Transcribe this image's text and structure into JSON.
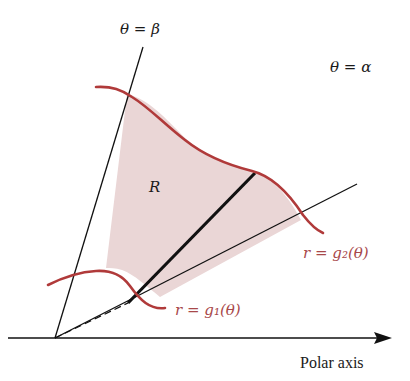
{
  "diagram": {
    "type": "polar-region",
    "labels": {
      "theta_beta": "θ = β",
      "theta_alpha": "θ = α",
      "region": "R",
      "outer_curve": "r = g₂(θ)",
      "inner_curve": "r = g₁(θ)",
      "axis": "Polar axis"
    },
    "colors": {
      "curve": "#b03a3a",
      "region_fill": "#ead6d6",
      "lines": "#111111",
      "curve_label": "#a8484a"
    }
  }
}
